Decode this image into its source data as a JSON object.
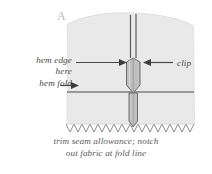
{
  "figure": {
    "panel_letter": "A",
    "caption_line1": "trim seam allowance; notch",
    "caption_line2": "out fabric at fold line",
    "labels": {
      "hem_edge_line1": "hem edge",
      "hem_edge_line2": "here",
      "hem_fold": "hem fold",
      "clip": "clip"
    },
    "colors": {
      "fabric": "#e8e8e8",
      "fabric_edge": "#d4d4d4",
      "notch_fill": "#bdbdbd",
      "seam_line": "#555555",
      "fold_line": "#7a7a7a",
      "zigzag": "#8a8a8a",
      "text": "#4a4a4a",
      "panel_letter": "#b9b9b9",
      "background": "#ffffff"
    }
  }
}
